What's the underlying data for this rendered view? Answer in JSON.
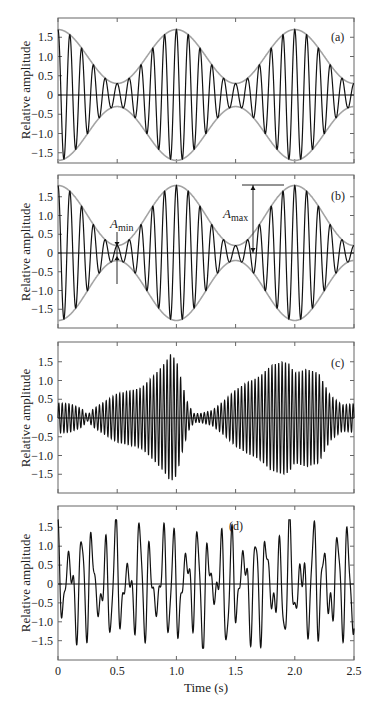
{
  "chart_data": [
    {
      "type": "line",
      "panel_label": "(a)",
      "title": "",
      "xlabel": "",
      "ylabel": "Relative amplitude",
      "xlim": [
        0,
        2.5
      ],
      "ylim": [
        -1.95,
        1.95
      ],
      "yticks": [
        "1.5",
        "1.0",
        "0.5",
        "0",
        "-0.5",
        "-1.0",
        "-1.5"
      ],
      "ytick_values": [
        1.5,
        1.0,
        0.5,
        0,
        -0.5,
        -1.0,
        -1.5
      ],
      "xtick_values": [
        0,
        0.5,
        1.0,
        1.5,
        2.0,
        2.5
      ],
      "grid": false,
      "description": "Beating signal: sum of two sinusoids with near-equal frequencies (~10 Hz carrier, ~1 Hz beat); amplitude modulates between ~0.3 and ~1.7 with gray envelope",
      "series": [
        {
          "name": "signal",
          "color": "#111111",
          "carrier_hz": 10,
          "beat_hz": 1,
          "A_max": 1.7,
          "A_min": 0.3,
          "envelope_max_at_s": [
            0,
            1.0,
            2.0
          ],
          "envelope_min_at_s": [
            0.5,
            1.5
          ]
        },
        {
          "name": "envelope",
          "color": "#a0a0a0"
        }
      ]
    },
    {
      "type": "line",
      "panel_label": "(b)",
      "title": "",
      "xlabel": "",
      "ylabel": "Relative amplitude",
      "xlim": [
        0,
        2.5
      ],
      "ylim": [
        -1.95,
        1.95
      ],
      "yticks": [
        "1.5",
        "1.0",
        "0.5",
        "0",
        "-0.5",
        "-1.0",
        "-1.5"
      ],
      "ytick_values": [
        1.5,
        1.0,
        0.5,
        0,
        -0.5,
        -1.0,
        -1.5
      ],
      "xtick_values": [
        0,
        0.5,
        1.0,
        1.5,
        2.0,
        2.5
      ],
      "grid": false,
      "description": "Beating signal with deeper modulation; annotated A_min (~0.2 at t=0.5 s) and A_max (~1.8 at t≈1.75 s marker)",
      "annotations": [
        {
          "text": "A",
          "subscript": "min",
          "x": 0.5,
          "value": 0.2
        },
        {
          "text": "A",
          "subscript": "max",
          "x": 1.75,
          "value": 1.8
        }
      ],
      "series": [
        {
          "name": "signal",
          "color": "#111111",
          "carrier_hz": 10,
          "beat_hz": 1,
          "A_max": 1.8,
          "A_min": 0.2,
          "envelope_max_at_s": [
            0,
            1.0,
            2.0
          ],
          "envelope_min_at_s": [
            0.5,
            1.5
          ]
        },
        {
          "name": "envelope",
          "color": "#a0a0a0"
        }
      ]
    },
    {
      "type": "line",
      "panel_label": "(c)",
      "title": "",
      "xlabel": "",
      "ylabel": "Relative amplitude",
      "xlim": [
        0,
        2.5
      ],
      "ylim": [
        -1.95,
        1.95
      ],
      "yticks": [
        "1.5",
        "1.0",
        "0.5",
        "0",
        "-0.5",
        "-1.0",
        "-1.5"
      ],
      "ytick_values": [
        1.5,
        1.0,
        0.5,
        0,
        -0.5,
        -1.0,
        -1.5
      ],
      "xtick_values": [
        0,
        0.5,
        1.0,
        1.5,
        2.0,
        2.5
      ],
      "grid": false,
      "description": "Dense high-frequency oscillation with irregular amplitude envelope; peaks ~1.7 near t≈0.95 s and ~1.5 near t≈1.95 s",
      "envelope_points": {
        "t": [
          0,
          0.1,
          0.2,
          0.25,
          0.3,
          0.4,
          0.5,
          0.6,
          0.7,
          0.8,
          0.9,
          0.95,
          1.0,
          1.05,
          1.1,
          1.15,
          1.2,
          1.3,
          1.4,
          1.5,
          1.6,
          1.7,
          1.8,
          1.9,
          1.95,
          2.0,
          2.1,
          2.2,
          2.3,
          2.4,
          2.5
        ],
        "amplitude": [
          0.4,
          0.38,
          0.25,
          0.08,
          0.25,
          0.45,
          0.65,
          0.72,
          0.8,
          1.1,
          1.45,
          1.7,
          1.55,
          0.9,
          0.35,
          0.12,
          0.12,
          0.2,
          0.45,
          0.75,
          0.95,
          1.1,
          1.4,
          1.5,
          1.45,
          1.2,
          1.3,
          1.2,
          0.6,
          0.35,
          0.38
        ]
      },
      "series": [
        {
          "name": "signal",
          "color": "#111111",
          "carrier_hz": 35
        }
      ]
    },
    {
      "type": "line",
      "panel_label": "(d)",
      "title": "",
      "xlabel": "Time (s)",
      "ylabel": "Relative amplitude",
      "xlim": [
        0,
        2.5
      ],
      "ylim": [
        -1.95,
        1.95
      ],
      "xticks": [
        "0",
        "0.5",
        "1.0",
        "1.5",
        "2.0",
        "2.5"
      ],
      "xtick_values": [
        0,
        0.5,
        1.0,
        1.5,
        2.0,
        2.5
      ],
      "yticks": [
        "1.5",
        "1.0",
        "0.5",
        "0",
        "-0.5",
        "-1.0",
        "-1.5"
      ],
      "ytick_values": [
        1.5,
        1.0,
        0.5,
        0,
        -0.5,
        -1.0,
        -1.5
      ],
      "grid": false,
      "description": "Irregular oscillating waveform (~10-15 Hz) with peaks reaching about +/-1.6",
      "series": [
        {
          "name": "signal",
          "color": "#111111"
        }
      ]
    }
  ],
  "axes": {
    "ylabel": "Relative amplitude",
    "xlabel": "Time (s)",
    "xticks": [
      "0",
      "0.5",
      "1.0",
      "1.5",
      "2.0",
      "2.5"
    ],
    "yticks": [
      "1.5",
      "1.0",
      "0.5",
      "0",
      "−0.5",
      "−1.0",
      "−1.5"
    ]
  },
  "panels": [
    {
      "label": "(a)"
    },
    {
      "label": "(b)",
      "annotation_min": "A",
      "annotation_min_sub": "min",
      "annotation_max": "A",
      "annotation_max_sub": "max"
    },
    {
      "label": "(c)"
    },
    {
      "label": "(d)"
    }
  ],
  "colors": {
    "signal": "#111111",
    "envelope": "#a3a3a3",
    "frame": "#555555",
    "zero_line": "#111111"
  }
}
